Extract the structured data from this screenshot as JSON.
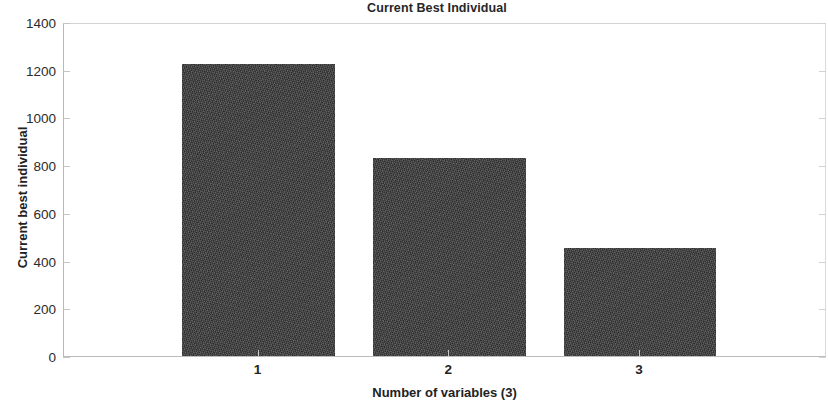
{
  "chart_data": {
    "type": "bar",
    "title": "Current Best Individual",
    "xlabel": "Number of variables (3)",
    "ylabel": "Current best individual",
    "categories": [
      "1",
      "2",
      "3"
    ],
    "values": [
      1224,
      830,
      453
    ],
    "ylim": [
      0,
      1400
    ],
    "yticks": [
      0,
      200,
      400,
      600,
      800,
      1000,
      1200,
      1400
    ],
    "ytick_labels": [
      "0",
      "200",
      "400",
      "600",
      "800",
      "1000",
      "1200",
      "1400"
    ],
    "xticks": [
      1,
      2,
      3
    ],
    "xtick_labels": [
      "1",
      "2",
      "3"
    ],
    "grid": false,
    "legend": null,
    "bar_color": "#3c3c3c",
    "axis_color": "#c0c0c0",
    "background_color": "#ffffff",
    "series": [
      {
        "name": "Current best individual",
        "values": [
          1224,
          830,
          453
        ]
      }
    ]
  }
}
